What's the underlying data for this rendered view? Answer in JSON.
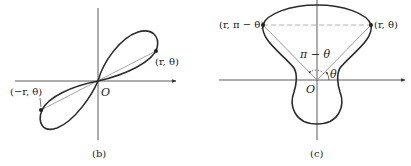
{
  "figures": [
    {
      "id": "b",
      "caption": "(b)",
      "origin_label": "O",
      "point_labels": {
        "p1": "(r, θ)",
        "p2": "(−r, θ)"
      },
      "description": "Lemniscate-like figure-eight through origin, symmetric about the origin"
    },
    {
      "id": "c",
      "caption": "(c)",
      "origin_label": "O",
      "point_labels": {
        "p1": "(r, θ)",
        "p2": "(r, π − θ)"
      },
      "angle_labels": {
        "theta": "θ",
        "pi_minus_theta": "π − θ"
      },
      "description": "Polar curve symmetric about the vertical axis"
    }
  ],
  "colors": {
    "curve": "#2b2b2b",
    "axis": "#333333",
    "radius": "#9a9a9a",
    "dashed": "#a8a8a8"
  }
}
